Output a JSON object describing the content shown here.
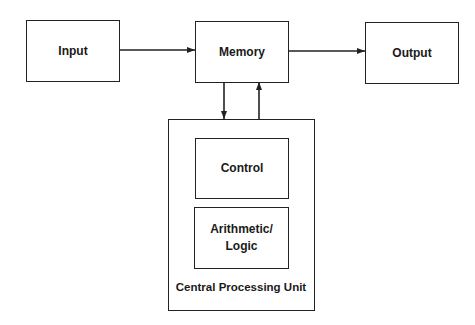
{
  "diagram": {
    "nodes": {
      "input": {
        "label": "Input"
      },
      "memory": {
        "label": "Memory"
      },
      "output": {
        "label": "Output"
      },
      "cpu": {
        "label": "Central Processing Unit"
      },
      "control": {
        "label": "Control"
      },
      "alu": {
        "label": "Arithmetic/\nLogic",
        "line1": "Arithmetic/",
        "line2": "Logic"
      }
    },
    "edges": [
      {
        "from": "input",
        "to": "memory"
      },
      {
        "from": "memory",
        "to": "output"
      },
      {
        "from": "memory",
        "to": "cpu"
      },
      {
        "from": "cpu",
        "to": "memory"
      }
    ]
  }
}
